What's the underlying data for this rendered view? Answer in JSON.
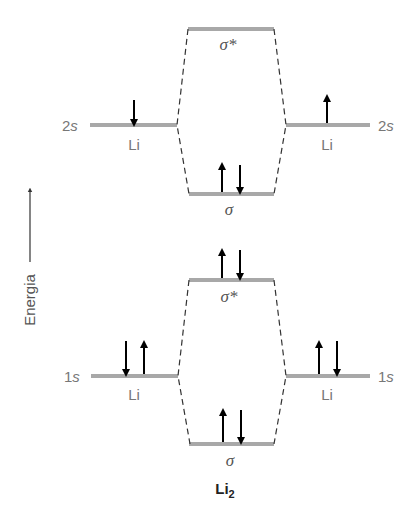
{
  "diagram": {
    "title": "Li2",
    "molecule": {
      "base": "Li",
      "subscript": "2"
    },
    "axis": {
      "label": "Energia"
    },
    "atoms": {
      "left": "Li",
      "right": "Li"
    },
    "levels": {
      "2s": {
        "atomic_label": "2s",
        "left_electrons": [
          "down"
        ],
        "right_electrons": [
          "up"
        ],
        "antibonding": {
          "label": "σ*",
          "electrons": []
        },
        "bonding": {
          "label": "σ",
          "electrons": [
            "up",
            "down"
          ]
        }
      },
      "1s": {
        "atomic_label": "1s",
        "left_electrons": [
          "down",
          "up"
        ],
        "right_electrons": [
          "up",
          "down"
        ],
        "antibonding": {
          "label": "σ*",
          "electrons": [
            "up",
            "down"
          ]
        },
        "bonding": {
          "label": "σ",
          "electrons": [
            "up",
            "down"
          ]
        }
      }
    },
    "colors": {
      "level": "#a8a8a8",
      "label": "#777777",
      "arrow": "#000000"
    }
  }
}
